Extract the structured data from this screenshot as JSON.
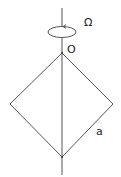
{
  "diagram": {
    "labels": {
      "omega": "Ω",
      "origin": "O",
      "side": "a"
    },
    "colors": {
      "stroke": "#555555",
      "text": "#222222"
    }
  }
}
